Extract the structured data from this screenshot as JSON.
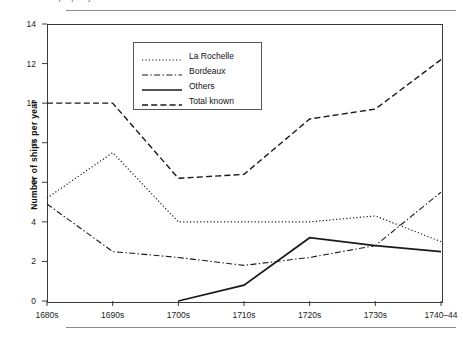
{
  "caption": {
    "clipped_top_text": "Number of ships per year"
  },
  "chart_data": {
    "type": "line",
    "title": "",
    "xlabel": "",
    "ylabel": "Number of ships per year",
    "categories": [
      "1680s",
      "1690s",
      "1700s",
      "1710s",
      "1720s",
      "1730s",
      "1740–44"
    ],
    "ylim": [
      0,
      14
    ],
    "yticks": [
      0,
      2,
      4,
      6,
      8,
      10,
      12,
      14
    ],
    "grid": false,
    "legend_position": "top-center-inside",
    "series": [
      {
        "name": "La Rochelle",
        "style": "dotted",
        "values": [
          5.2,
          7.5,
          4.0,
          4.0,
          4.0,
          4.3,
          3.0
        ]
      },
      {
        "name": "Bordeaux",
        "style": "dash-dot",
        "values": [
          4.9,
          2.5,
          2.2,
          1.8,
          2.2,
          2.8,
          5.5
        ]
      },
      {
        "name": "Others",
        "style": "solid",
        "values": [
          null,
          null,
          0.0,
          0.8,
          3.2,
          2.8,
          2.5
        ]
      },
      {
        "name": "Total known",
        "style": "dashed",
        "values": [
          10.0,
          10.0,
          6.2,
          6.4,
          9.2,
          9.7,
          12.2
        ]
      }
    ]
  },
  "legend": {
    "entries": [
      {
        "label": "La Rochelle"
      },
      {
        "label": "Bordeaux"
      },
      {
        "label": "Others"
      },
      {
        "label": "Total known"
      }
    ]
  },
  "axis": {
    "y_tick_labels": [
      "0",
      "2",
      "4",
      "6",
      "8",
      "10",
      "12",
      "14"
    ],
    "x_tick_labels": [
      "1680s",
      "1690s",
      "1700s",
      "1710s",
      "1720s",
      "1730s",
      "1740–44"
    ]
  },
  "colors": {
    "line": "#1a1a1a",
    "axis": "#3a3a3a",
    "rule": "#8a8a8a",
    "background": "#ffffff"
  }
}
